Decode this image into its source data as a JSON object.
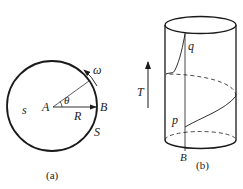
{
  "figure_a": {
    "caption": "(a)",
    "labels": {
      "center": "A",
      "point": "B",
      "radius": "R",
      "angle": "θ",
      "angular_velocity": "ω",
      "inside": "s",
      "boundary": "S"
    }
  },
  "figure_b": {
    "caption": "(b)",
    "labels": {
      "time_axis": "T",
      "upper_point": "q",
      "lower_point": "p",
      "base_point": "B"
    }
  },
  "colors": {
    "stroke": "#1a1a1a",
    "background": "#ffffff"
  }
}
